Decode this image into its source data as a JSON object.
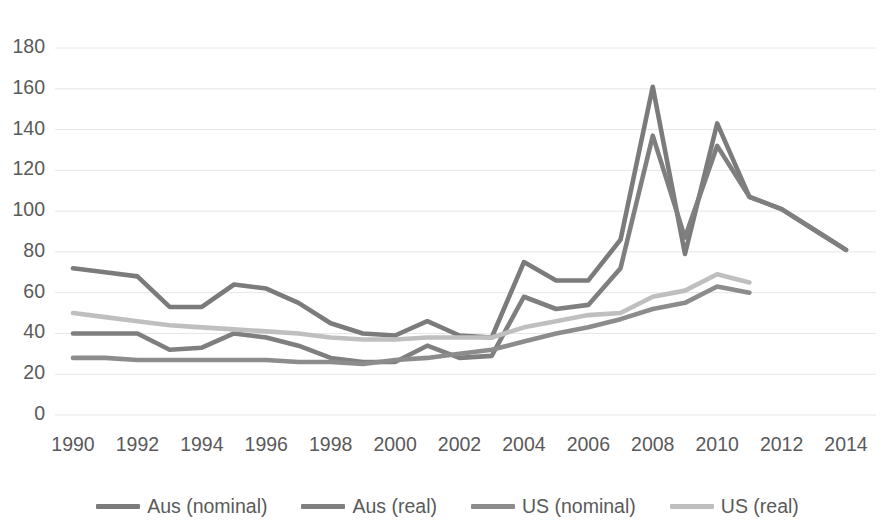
{
  "chart_data": {
    "type": "line",
    "title": "",
    "xlabel": "",
    "ylabel": "",
    "xlim": [
      1990,
      2014
    ],
    "ylim": [
      0,
      180
    ],
    "ytick_step": 20,
    "xtick_step": 2,
    "grid": true,
    "legend_position": "bottom",
    "x": [
      1990,
      1991,
      1992,
      1993,
      1994,
      1995,
      1996,
      1997,
      1998,
      1999,
      2000,
      2001,
      2002,
      2003,
      2004,
      2005,
      2006,
      2007,
      2008,
      2009,
      2010,
      2011,
      2012,
      2013,
      2014
    ],
    "ytick_labels": [
      "0",
      "20",
      "40",
      "60",
      "80",
      "100",
      "120",
      "140",
      "160",
      "180"
    ],
    "xtick_labels": [
      "1990",
      "1992",
      "1994",
      "1996",
      "1998",
      "2000",
      "2002",
      "2004",
      "2006",
      "2008",
      "2010",
      "2012",
      "2014"
    ],
    "series": [
      {
        "name": "Aus (nominal)",
        "color": "#7b7b7b",
        "values": [
          72,
          70,
          68,
          53,
          53,
          64,
          62,
          55,
          45,
          40,
          39,
          46,
          39,
          38,
          75,
          66,
          66,
          86,
          161,
          79,
          143,
          107,
          101,
          91,
          81
        ]
      },
      {
        "name": "Aus (real)",
        "color": "#7f7f7f",
        "values": [
          40,
          40,
          40,
          32,
          33,
          40,
          38,
          34,
          28,
          26,
          26,
          34,
          28,
          29,
          58,
          52,
          54,
          72,
          137,
          87,
          132,
          107,
          101,
          91,
          81
        ]
      },
      {
        "name": "US (nominal)",
        "color": "#8c8c8c",
        "values": [
          28,
          28,
          27,
          27,
          27,
          27,
          27,
          26,
          26,
          25,
          27,
          28,
          30,
          32,
          36,
          40,
          43,
          47,
          52,
          55,
          63,
          60,
          null,
          null,
          null
        ]
      },
      {
        "name": "US (real)",
        "color": "#bfbfbf",
        "values": [
          50,
          48,
          46,
          44,
          43,
          42,
          41,
          40,
          38,
          37,
          37,
          38,
          38,
          38,
          43,
          46,
          49,
          50,
          58,
          61,
          69,
          65,
          null,
          null,
          null
        ]
      }
    ]
  },
  "legend": {
    "items": [
      {
        "label": "Aus (nominal)",
        "color": "#7b7b7b"
      },
      {
        "label": "Aus (real)",
        "color": "#7f7f7f"
      },
      {
        "label": "US (nominal)",
        "color": "#8c8c8c"
      },
      {
        "label": "US (real)",
        "color": "#bfbfbf"
      }
    ]
  },
  "style": {
    "grid_color": "#e6e6e6",
    "text_color": "#5a5a5a",
    "background": "#ffffff"
  }
}
